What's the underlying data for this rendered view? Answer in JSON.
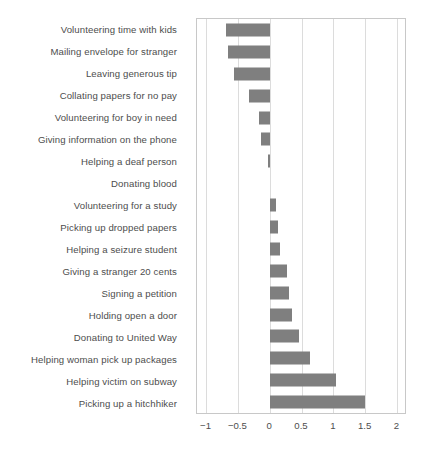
{
  "chart_data": {
    "type": "bar",
    "orientation": "horizontal",
    "title": "",
    "xlabel": "",
    "ylabel": "",
    "xlim": [
      -1.15,
      2.15
    ],
    "xticks": [
      -1,
      -0.5,
      0,
      0.5,
      1,
      1.5,
      2
    ],
    "xtick_labels": [
      "−1",
      "−0.5",
      "0",
      "0.5",
      "1",
      "1.5",
      "2"
    ],
    "grid": "vertical",
    "legend": "none",
    "bar_color": "#7f7f7f",
    "axis_color": "#c8c8c8",
    "grid_color": "#dcdcdc",
    "text_color": "#4d4d4d",
    "categories": [
      "Volunteering time with kids",
      "Mailing envelope for stranger",
      "Leaving generous tip",
      "Collating papers for no pay",
      "Volunteering for boy in need",
      "Giving information on the phone",
      "Helping a deaf person",
      "Donating blood",
      "Volunteering for a study",
      "Picking up dropped papers",
      "Helping a seizure student",
      "Giving a stranger 20 cents",
      "Signing a petition",
      "Holding open a door",
      "Donating to United Way",
      "Helping woman pick up packages",
      "Helping victim on subway",
      "Picking up a hitchhiker"
    ],
    "values": [
      -0.69,
      -0.66,
      -0.57,
      -0.33,
      -0.17,
      -0.14,
      -0.03,
      0.0,
      0.09,
      0.12,
      0.15,
      0.26,
      0.3,
      0.34,
      0.45,
      0.63,
      1.03,
      1.49
    ]
  }
}
